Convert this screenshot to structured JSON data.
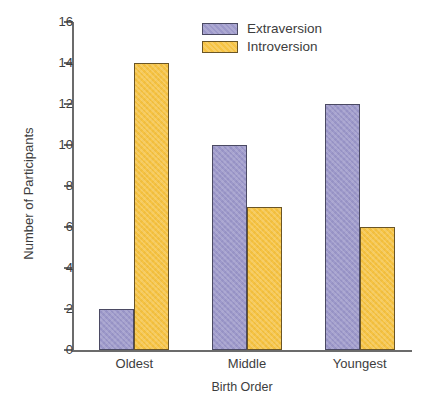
{
  "chart_data": {
    "type": "bar",
    "title": "",
    "subtitle": "",
    "xlabel": "Birth Order",
    "ylabel": "Number of Participants",
    "categories": [
      "Oldest",
      "Middle",
      "Youngest"
    ],
    "series": [
      {
        "name": "Extraversion",
        "color": "#9d99ca",
        "values": [
          2,
          10,
          12
        ]
      },
      {
        "name": "Introversion",
        "color": "#f6c343",
        "values": [
          14,
          7,
          6
        ]
      }
    ],
    "ylim": [
      0,
      16
    ],
    "ytick_step": 2,
    "yticks": [
      0,
      2,
      4,
      6,
      8,
      10,
      12,
      14,
      16
    ],
    "ytick_labels": [
      "0",
      "2",
      "4",
      "6",
      "8",
      "10",
      "12",
      "14",
      "16"
    ],
    "grid": false,
    "legend_position": "top-center",
    "legend_entries": [
      "Extraversion",
      "Introversion"
    ],
    "annotations": [],
    "axis_color": "#6b6b6b",
    "text_color": "#3d3d3d",
    "background_color": "#ffffff"
  }
}
